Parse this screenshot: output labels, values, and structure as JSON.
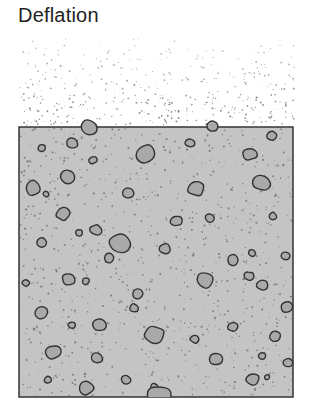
{
  "title": "Deflation",
  "colors": {
    "sediment_fill": "#c4c4c4",
    "pebble_fill": "#a9a9a9",
    "outline": "#333333",
    "dust": "#707070",
    "grain": "#6a6a6a"
  },
  "sediment_box": {
    "x": 19,
    "y": 127,
    "width": 274,
    "height": 270
  },
  "pebbles": [
    {
      "cx": 89,
      "cy": 127,
      "r": 9,
      "pos": "surface"
    },
    {
      "cx": 213,
      "cy": 126,
      "r": 6,
      "pos": "surface"
    },
    {
      "cx": 42,
      "cy": 148,
      "r": 4
    },
    {
      "cx": 72,
      "cy": 143,
      "r": 6
    },
    {
      "cx": 93,
      "cy": 160,
      "r": 4
    },
    {
      "cx": 146,
      "cy": 154,
      "r": 10
    },
    {
      "cx": 190,
      "cy": 143,
      "r": 5
    },
    {
      "cx": 250,
      "cy": 154,
      "r": 7
    },
    {
      "cx": 272,
      "cy": 136,
      "r": 5
    },
    {
      "cx": 68,
      "cy": 177,
      "r": 8
    },
    {
      "cx": 33,
      "cy": 188,
      "r": 8
    },
    {
      "cx": 46,
      "cy": 194,
      "r": 3
    },
    {
      "cx": 128,
      "cy": 193,
      "r": 6
    },
    {
      "cx": 196,
      "cy": 188,
      "r": 9
    },
    {
      "cx": 262,
      "cy": 183,
      "r": 9
    },
    {
      "cx": 63,
      "cy": 214,
      "r": 7
    },
    {
      "cx": 96,
      "cy": 230,
      "r": 6
    },
    {
      "cx": 176,
      "cy": 221,
      "r": 6
    },
    {
      "cx": 210,
      "cy": 218,
      "r": 5
    },
    {
      "cx": 273,
      "cy": 216,
      "r": 4
    },
    {
      "cx": 120,
      "cy": 243,
      "r": 11
    },
    {
      "cx": 42,
      "cy": 243,
      "r": 6
    },
    {
      "cx": 79,
      "cy": 233,
      "r": 4
    },
    {
      "cx": 165,
      "cy": 249,
      "r": 6
    },
    {
      "cx": 252,
      "cy": 253,
      "r": 4
    },
    {
      "cx": 286,
      "cy": 256,
      "r": 5
    },
    {
      "cx": 109,
      "cy": 258,
      "r": 5
    },
    {
      "cx": 69,
      "cy": 279,
      "r": 7
    },
    {
      "cx": 26,
      "cy": 283,
      "r": 4
    },
    {
      "cx": 86,
      "cy": 281,
      "r": 4
    },
    {
      "cx": 138,
      "cy": 294,
      "r": 6
    },
    {
      "cx": 205,
      "cy": 280,
      "r": 9
    },
    {
      "cx": 233,
      "cy": 260,
      "r": 6
    },
    {
      "cx": 249,
      "cy": 276,
      "r": 5
    },
    {
      "cx": 262,
      "cy": 285,
      "r": 6
    },
    {
      "cx": 41,
      "cy": 313,
      "r": 7
    },
    {
      "cx": 72,
      "cy": 325,
      "r": 4
    },
    {
      "cx": 99,
      "cy": 325,
      "r": 7
    },
    {
      "cx": 154,
      "cy": 335,
      "r": 10
    },
    {
      "cx": 134,
      "cy": 308,
      "r": 5
    },
    {
      "cx": 195,
      "cy": 339,
      "r": 5
    },
    {
      "cx": 233,
      "cy": 327,
      "r": 5
    },
    {
      "cx": 275,
      "cy": 336,
      "r": 6
    },
    {
      "cx": 287,
      "cy": 307,
      "r": 6
    },
    {
      "cx": 53,
      "cy": 352,
      "r": 8
    },
    {
      "cx": 97,
      "cy": 358,
      "r": 6
    },
    {
      "cx": 216,
      "cy": 359,
      "r": 7
    },
    {
      "cx": 262,
      "cy": 356,
      "r": 4
    },
    {
      "cx": 288,
      "cy": 363,
      "r": 5
    },
    {
      "cx": 48,
      "cy": 380,
      "r": 4
    },
    {
      "cx": 86,
      "cy": 388,
      "r": 8
    },
    {
      "cx": 126,
      "cy": 380,
      "r": 5
    },
    {
      "cx": 253,
      "cy": 379,
      "r": 7
    },
    {
      "cx": 154,
      "cy": 387,
      "r": 4
    },
    {
      "cx": 267,
      "cy": 377,
      "r": 3
    },
    {
      "cx": 159,
      "cy": 397,
      "r": 13,
      "pos": "bottom"
    }
  ],
  "dust_region": {
    "x": 20,
    "y": 35,
    "width": 275,
    "height": 90,
    "count": 420,
    "seed": 17
  },
  "grain_count": 900,
  "grain_seed": 7
}
